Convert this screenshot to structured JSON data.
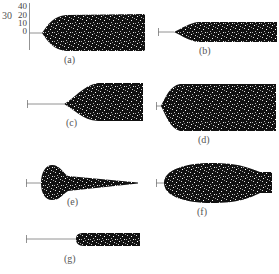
{
  "axis": {
    "left_label": "30",
    "ticks": [
      "40",
      "20",
      "10",
      "0"
    ]
  },
  "panels": [
    {
      "id": "a",
      "label": "(a)",
      "shape": "blunt-nose bullet"
    },
    {
      "id": "b",
      "label": "(b)",
      "shape": "thin conical-tip rod"
    },
    {
      "id": "c",
      "label": "(c)",
      "shape": "long-stem conical-taper rod"
    },
    {
      "id": "d",
      "label": "(d)",
      "shape": "wide rounded-nose rod"
    },
    {
      "id": "e",
      "label": "(e)",
      "shape": "bulb with tapering tail"
    },
    {
      "id": "f",
      "label": "(f)",
      "shape": "ellipsoid with necked tail"
    },
    {
      "id": "g",
      "label": "(g)",
      "shape": "long-stem narrow rod"
    }
  ],
  "colors": {
    "fill": "#111111",
    "speckle": "#ffffff",
    "stem": "#777777",
    "text": "#555555"
  }
}
